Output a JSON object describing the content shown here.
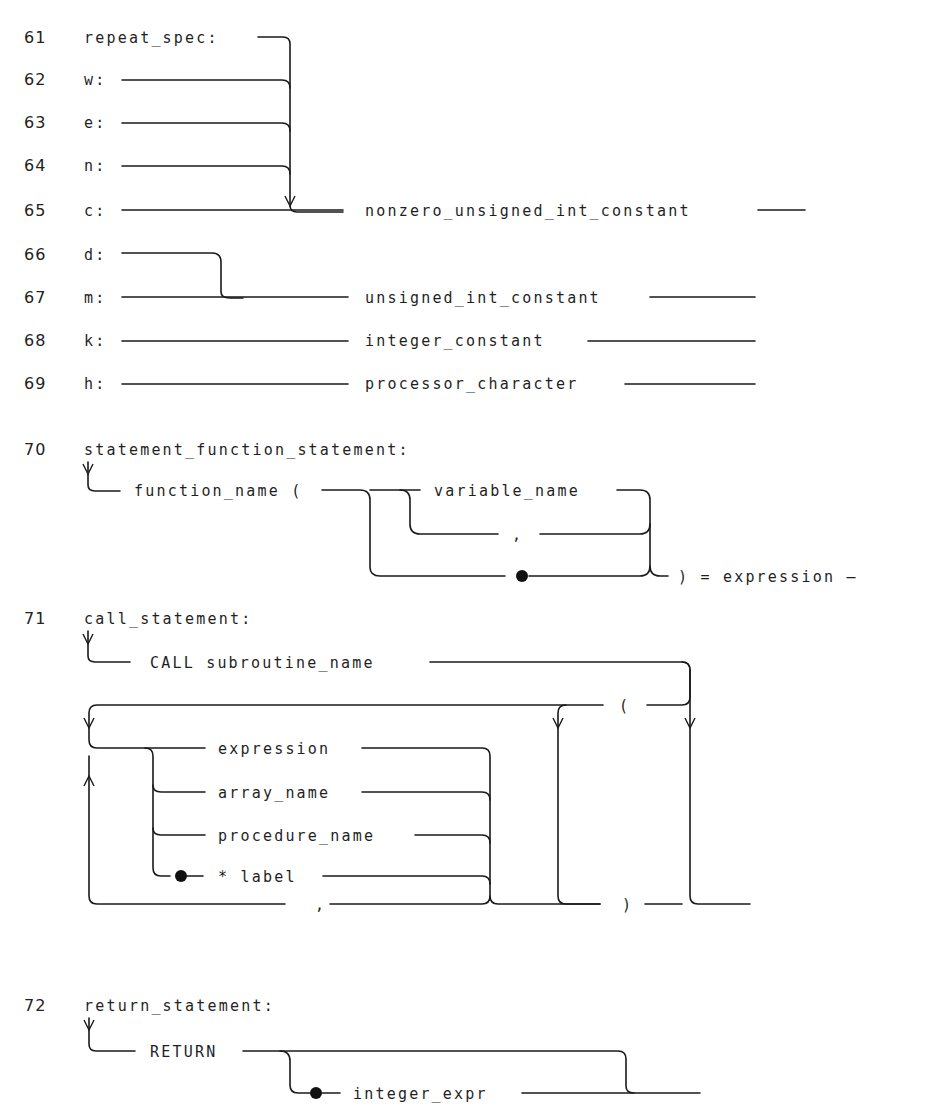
{
  "rules": {
    "r61": {
      "number": "61",
      "name": "repeat_spec:"
    },
    "r62": {
      "number": "62",
      "name": "w:"
    },
    "r63": {
      "number": "63",
      "name": "e:"
    },
    "r64": {
      "number": "64",
      "name": "n:"
    },
    "r65": {
      "number": "65",
      "name": "c:",
      "target": "nonzero_unsigned_int_constant"
    },
    "r66": {
      "number": "66",
      "name": "d:"
    },
    "r67": {
      "number": "67",
      "name": "m:",
      "target": "unsigned_int_constant"
    },
    "r68": {
      "number": "68",
      "name": "k:",
      "target": "integer_constant"
    },
    "r69": {
      "number": "69",
      "name": "h:",
      "target": "processor_character"
    },
    "r70": {
      "number": "70",
      "name": "statement_function_statement:",
      "function_name": "function_name (",
      "variable_name": "variable_name",
      "comma": ",",
      "tail": ") = expression –"
    },
    "r71": {
      "number": "71",
      "name": "call_statement:",
      "call": "CALL subroutine_name",
      "open_paren": "(",
      "options": [
        "expression",
        "array_name",
        "procedure_name",
        "* label"
      ],
      "comma": ",",
      "close_paren": ")"
    },
    "r72": {
      "number": "72",
      "name": "return_statement:",
      "keyword": "RETURN",
      "integer_expr": "integer_expr"
    }
  }
}
